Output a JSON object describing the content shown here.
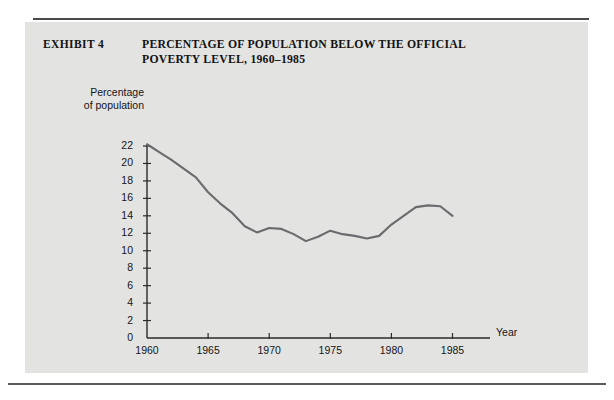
{
  "exhibit": {
    "label": "EXHIBIT 4",
    "title_line1": "PERCENTAGE OF POPULATION BELOW THE OFFICIAL",
    "title_line2": "POVERTY LEVEL, 1960–1985"
  },
  "colors": {
    "panel_background": "#e3e3e1",
    "page_background": "#ffffff",
    "line": "#6b6b6e",
    "axis": "#2b2b2b",
    "text": "#15151a"
  },
  "chart_data": {
    "type": "line",
    "title": "PERCENTAGE OF POPULATION BELOW THE OFFICIAL POVERTY LEVEL, 1960–1985",
    "xlabel": "Year",
    "ylabel": "Percentage of population",
    "xlim": [
      1960,
      1987
    ],
    "ylim": [
      0,
      23
    ],
    "grid": false,
    "legend": null,
    "yticks": [
      0,
      2,
      4,
      6,
      8,
      10,
      12,
      14,
      16,
      18,
      20,
      22
    ],
    "ytick_labels": [
      "0",
      "2",
      "4",
      "6",
      "8",
      "10",
      "12",
      "14",
      "16",
      "18",
      "20",
      "22"
    ],
    "xticks": [
      1960,
      1965,
      1970,
      1975,
      1980,
      1985
    ],
    "xtick_labels": [
      "1960",
      "1965",
      "1970",
      "1975",
      "1980",
      "1985"
    ],
    "series": [
      {
        "name": "Percentage of population below poverty level",
        "x": [
          1960,
          1961,
          1962,
          1963,
          1964,
          1965,
          1966,
          1967,
          1968,
          1969,
          1970,
          1971,
          1972,
          1973,
          1974,
          1975,
          1976,
          1977,
          1978,
          1979,
          1980,
          1981,
          1982,
          1983,
          1984,
          1985
        ],
        "values": [
          22.2,
          21.3,
          20.4,
          19.4,
          18.4,
          16.7,
          15.4,
          14.3,
          12.8,
          12.1,
          12.6,
          12.5,
          11.9,
          11.1,
          11.6,
          12.3,
          11.9,
          11.7,
          11.4,
          11.7,
          13.0,
          14.0,
          15.0,
          15.2,
          15.1,
          14.0
        ]
      }
    ]
  }
}
